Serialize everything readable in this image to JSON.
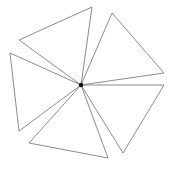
{
  "diagram": {
    "type": "pinwheel-triangles",
    "width": 173,
    "height": 169,
    "background": "#ffffff",
    "stroke_color": "#6e6e6e",
    "hub": {
      "x": 81,
      "y": 85,
      "radius": 2.2,
      "color": "#111111"
    },
    "triangles": [
      {
        "name": "triangle-top-left",
        "points": [
          [
            81,
            85
          ],
          [
            92,
            7
          ],
          [
            19,
            40
          ]
        ]
      },
      {
        "name": "triangle-top-right",
        "points": [
          [
            81,
            85
          ],
          [
            112,
            13
          ],
          [
            164,
            73
          ]
        ]
      },
      {
        "name": "triangle-bottom-right",
        "points": [
          [
            81,
            85
          ],
          [
            164,
            85
          ],
          [
            123,
            153
          ]
        ]
      },
      {
        "name": "triangle-bottom",
        "points": [
          [
            81,
            85
          ],
          [
            108,
            158
          ],
          [
            29,
            143
          ]
        ]
      },
      {
        "name": "triangle-left",
        "points": [
          [
            81,
            85
          ],
          [
            19,
            131
          ],
          [
            10,
            53
          ]
        ]
      }
    ]
  }
}
